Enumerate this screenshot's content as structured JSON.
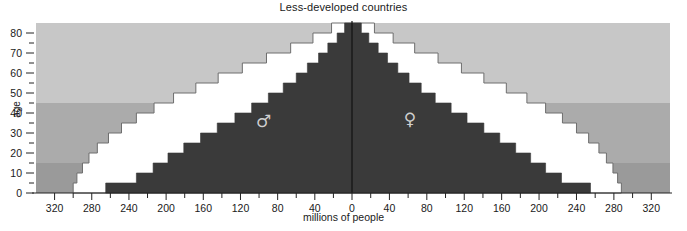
{
  "chart_data": {
    "type": "bar",
    "title": "Less-developed countries",
    "xlabel": "millions of people",
    "ylabel": "age",
    "orientation": "population-pyramid",
    "grid": false,
    "legend": "none",
    "xlim": [
      -340,
      340
    ],
    "ylim": [
      0,
      85
    ],
    "x_tick_labels": [
      "320",
      "280",
      "240",
      "200",
      "160",
      "120",
      "80",
      "40",
      "0",
      "40",
      "80",
      "120",
      "160",
      "200",
      "240",
      "280",
      "320"
    ],
    "x_tick_values": [
      -320,
      -280,
      -240,
      -200,
      -160,
      -120,
      -80,
      -40,
      0,
      40,
      80,
      120,
      160,
      200,
      240,
      280,
      320
    ],
    "x_minor_step": 20,
    "y_tick_labels": [
      "0",
      "10",
      "20",
      "30",
      "40",
      "50",
      "60",
      "70",
      "80"
    ],
    "y_tick_values": [
      0,
      10,
      20,
      30,
      40,
      50,
      60,
      70,
      80
    ],
    "y_minor_step": 5,
    "age_groups": [
      "0-4",
      "5-9",
      "10-14",
      "15-19",
      "20-24",
      "25-29",
      "30-34",
      "35-39",
      "40-44",
      "45-49",
      "50-54",
      "55-59",
      "60-64",
      "65-69",
      "70-74",
      "75-79",
      "80+"
    ],
    "annotations": [
      {
        "name": "male-symbol",
        "symbol": "♂",
        "side": "left",
        "x": -95,
        "y": 33
      },
      {
        "name": "female-symbol",
        "symbol": "♀",
        "side": "right",
        "x": 62,
        "y": 34
      }
    ],
    "background_bands": [
      {
        "name": "youth-band",
        "from": 0,
        "to": 15,
        "color": "#9a9a9a"
      },
      {
        "name": "working-age-band",
        "from": 15,
        "to": 45,
        "color": "#ababab"
      },
      {
        "name": "older-band",
        "from": 45,
        "to": 85,
        "color": "#c7c7c7"
      }
    ],
    "series": [
      {
        "name": "Projected (outer)",
        "fill": "#ffffff",
        "stroke": "#6e6e6e",
        "male": [
          300,
          296,
          290,
          283,
          274,
          262,
          248,
          232,
          213,
          192,
          168,
          144,
          118,
          92,
          66,
          42,
          22
        ],
        "female": [
          288,
          284,
          279,
          272,
          264,
          253,
          240,
          225,
          207,
          187,
          165,
          141,
          117,
          92,
          67,
          44,
          24
        ]
      },
      {
        "name": "Current (inner)",
        "fill": "#3a3a3a",
        "stroke": "#3a3a3a",
        "male": [
          265,
          232,
          214,
          198,
          181,
          163,
          145,
          126,
          108,
          90,
          74,
          60,
          48,
          36,
          26,
          16,
          8
        ],
        "female": [
          255,
          224,
          207,
          191,
          175,
          158,
          141,
          123,
          106,
          89,
          74,
          61,
          49,
          38,
          28,
          18,
          10
        ]
      }
    ]
  }
}
